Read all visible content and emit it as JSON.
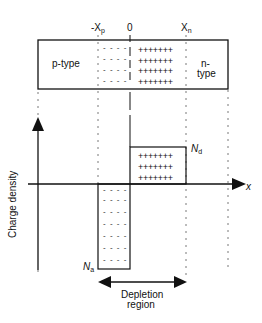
{
  "diagram": {
    "title": "",
    "top_labels": {
      "neg_xp": "-X",
      "neg_xp_sub": "p",
      "zero": "0",
      "xn": "X",
      "xn_sub": "n"
    },
    "regions": {
      "p_type": "p-type",
      "n_type_line1": "n-",
      "n_type_line2": "type"
    },
    "axis": {
      "y_label": "Charge density",
      "x_label": "x"
    },
    "levels": {
      "nd": "N",
      "nd_sub": "d",
      "na": "N",
      "na_sub": "a"
    },
    "depletion": {
      "line1": "Depletion",
      "line2": "region"
    },
    "symbols": {
      "positive_row": "+++++++",
      "negative_row": "- - - -",
      "junction_positive_rows": 4,
      "junction_negative_rows": 4,
      "density_positive_rows": 3,
      "density_negative_rows": 8
    },
    "colors": {
      "line": "#111111",
      "dotted": "#555555",
      "background": "#ffffff"
    }
  }
}
